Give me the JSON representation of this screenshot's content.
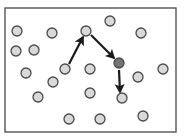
{
  "figure": {
    "title": "",
    "type": "node-graph-diagram",
    "canvas": {
      "width": 184,
      "height": 140,
      "background": "#ffffff"
    },
    "frame": {
      "name": "plot-frame-border",
      "x": 5,
      "y": 8,
      "width": 171,
      "height": 124,
      "stroke_color": "#555555",
      "stroke_width": 1.4,
      "fill_color": "#ffffff"
    },
    "styles": {
      "node_radius": 5.0,
      "node_fill_light": "#d9d9d9",
      "node_fill_highlight": "#737373",
      "node_stroke": "#4a4a4a",
      "node_stroke_width": 1.3,
      "arrow_color": "#1a1a1a",
      "arrow_width": 2.2,
      "arrow_head_size": 6
    },
    "nodes": [
      {
        "id": "n1",
        "label": "",
        "cx": 17,
        "cy": 31,
        "state": "normal"
      },
      {
        "id": "n2",
        "label": "",
        "cx": 52,
        "cy": 33,
        "state": "normal"
      },
      {
        "id": "n3",
        "label": "",
        "cx": 110,
        "cy": 21,
        "state": "normal"
      },
      {
        "id": "n4",
        "label": "",
        "cx": 141,
        "cy": 33,
        "state": "normal"
      },
      {
        "id": "n5",
        "label": "",
        "cx": 16,
        "cy": 51,
        "state": "normal"
      },
      {
        "id": "n6",
        "label": "",
        "cx": 34,
        "cy": 50,
        "state": "normal"
      },
      {
        "id": "n7",
        "label": "",
        "cx": 86,
        "cy": 31,
        "state": "normal"
      },
      {
        "id": "n8",
        "label": "",
        "cx": 26,
        "cy": 73,
        "state": "normal"
      },
      {
        "id": "n9",
        "label": "",
        "cx": 65,
        "cy": 69,
        "state": "normal"
      },
      {
        "id": "n10",
        "label": "",
        "cx": 90,
        "cy": 69,
        "state": "normal"
      },
      {
        "id": "n11",
        "label": "",
        "cx": 119,
        "cy": 63,
        "state": "highlight"
      },
      {
        "id": "n12",
        "label": "",
        "cx": 163,
        "cy": 69,
        "state": "normal"
      },
      {
        "id": "n13",
        "label": "",
        "cx": 138,
        "cy": 77,
        "state": "normal"
      },
      {
        "id": "n14",
        "label": "",
        "cx": 53,
        "cy": 82,
        "state": "normal"
      },
      {
        "id": "n15",
        "label": "",
        "cx": 38,
        "cy": 97,
        "state": "normal"
      },
      {
        "id": "n16",
        "label": "",
        "cx": 90,
        "cy": 93,
        "state": "normal"
      },
      {
        "id": "n17",
        "label": "",
        "cx": 122,
        "cy": 98,
        "state": "normal"
      },
      {
        "id": "n18",
        "label": "",
        "cx": 69,
        "cy": 119,
        "state": "normal"
      },
      {
        "id": "n19",
        "label": "",
        "cx": 100,
        "cy": 119,
        "state": "normal"
      },
      {
        "id": "n20",
        "label": "",
        "cx": 143,
        "cy": 116,
        "state": "normal"
      }
    ],
    "arrows": [
      {
        "id": "a1",
        "label": "",
        "from": "n9",
        "to": "n7",
        "x1": 69,
        "y1": 64,
        "x2": 83,
        "y2": 37
      },
      {
        "id": "a2",
        "label": "",
        "from": "n7",
        "to": "n11",
        "x1": 91,
        "y1": 35,
        "x2": 114,
        "y2": 58
      },
      {
        "id": "a3",
        "label": "",
        "from": "n11",
        "to": "n17",
        "x1": 119,
        "y1": 70,
        "x2": 120,
        "y2": 92
      }
    ]
  }
}
